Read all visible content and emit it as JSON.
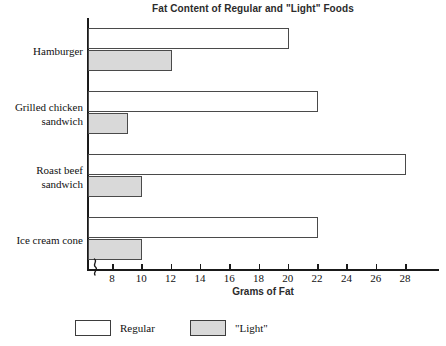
{
  "chart_data": {
    "type": "bar",
    "orientation": "horizontal",
    "title": "Fat Content of Regular and \"Light\" Foods",
    "xlabel": "Grams of Fat",
    "ylabel": "",
    "xlim": [
      7,
      29
    ],
    "axis_break": true,
    "grid": false,
    "legend_position": "bottom",
    "xticks": [
      8,
      10,
      12,
      14,
      16,
      18,
      20,
      22,
      24,
      26,
      28
    ],
    "xtick_labels": [
      "8",
      "10",
      "12",
      "14",
      "16",
      "18",
      "20",
      "22",
      "24",
      "26",
      "28"
    ],
    "categories": [
      "Hamburger",
      "Grilled chicken sandwich",
      "Roast beef sandwich",
      "Ice cream cone"
    ],
    "category_label_lines": [
      [
        "Hamburger"
      ],
      [
        "Grilled chicken",
        "sandwich"
      ],
      [
        "Roast beef",
        "sandwich"
      ],
      [
        "Ice cream cone"
      ]
    ],
    "series": [
      {
        "name": "Regular",
        "color": "#ffffff",
        "edge_color": "#4a4a4a",
        "values": [
          20,
          22,
          28,
          22
        ]
      },
      {
        "name": "\"Light\"",
        "color": "#d9d9d9",
        "edge_color": "#4a4a4a",
        "values": [
          12,
          9,
          10,
          10
        ]
      }
    ]
  },
  "legend": {
    "items": [
      {
        "label": "Regular",
        "swatch": "white-swatch"
      },
      {
        "label": "\"Light\"",
        "swatch": "gray-swatch"
      }
    ]
  },
  "colors": {
    "regular_fill": "#ffffff",
    "light_fill": "#d9d9d9",
    "axis": "#1a1a1a",
    "text": "#111111",
    "title_text": "#2b2b2b"
  }
}
